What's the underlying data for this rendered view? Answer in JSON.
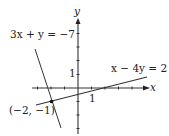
{
  "diagram": {
    "type": "coordinate-graph",
    "axes": {
      "x_label": "x",
      "y_label": "y",
      "x_tick_label": "1",
      "y_tick_label": "1"
    },
    "lines": [
      {
        "equation": "3x + y = −7",
        "color": "#333333"
      },
      {
        "equation": "x − 4y = 2",
        "color": "#333333"
      }
    ],
    "intersection": {
      "label": "(−2, −1)",
      "x": -2,
      "y": -1
    }
  }
}
